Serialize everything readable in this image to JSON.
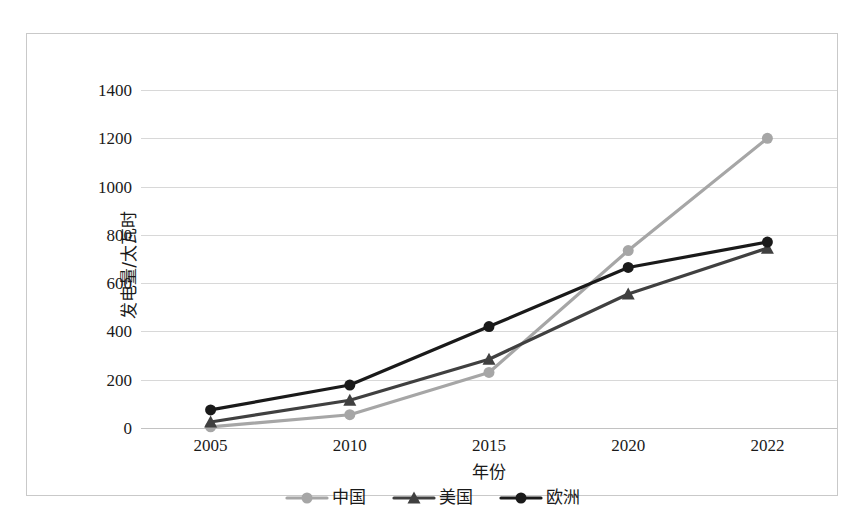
{
  "chart_data": {
    "type": "line",
    "title": "",
    "xlabel": "年份",
    "ylabel": "发电量/太瓦时",
    "categories": [
      "2005",
      "2010",
      "2015",
      "2020",
      "2022"
    ],
    "xtick_labels": [
      "2005",
      "2010",
      "2015",
      "2020",
      "2022"
    ],
    "ytick_labels": [
      "0",
      "200",
      "400",
      "600",
      "800",
      "1000",
      "1200",
      "1400"
    ],
    "ylim": [
      0,
      1400
    ],
    "ytick_step": 200,
    "grid": true,
    "legend_position": "bottom",
    "series": [
      {
        "name": "中国",
        "color": "#a6a6a6",
        "marker": "circle",
        "values": [
          5,
          55,
          230,
          735,
          1200
        ]
      },
      {
        "name": "美国",
        "color": "#404040",
        "marker": "triangle",
        "values": [
          25,
          115,
          285,
          555,
          745
        ]
      },
      {
        "name": "欧洲",
        "color": "#1a1a1a",
        "marker": "circle",
        "values": [
          75,
          178,
          420,
          665,
          770
        ]
      }
    ]
  },
  "legend": {
    "entries": [
      {
        "label": "中国"
      },
      {
        "label": "美国"
      },
      {
        "label": "欧洲"
      }
    ]
  },
  "axes": {
    "y_title": "发电量/太瓦时",
    "x_title": "年份"
  }
}
